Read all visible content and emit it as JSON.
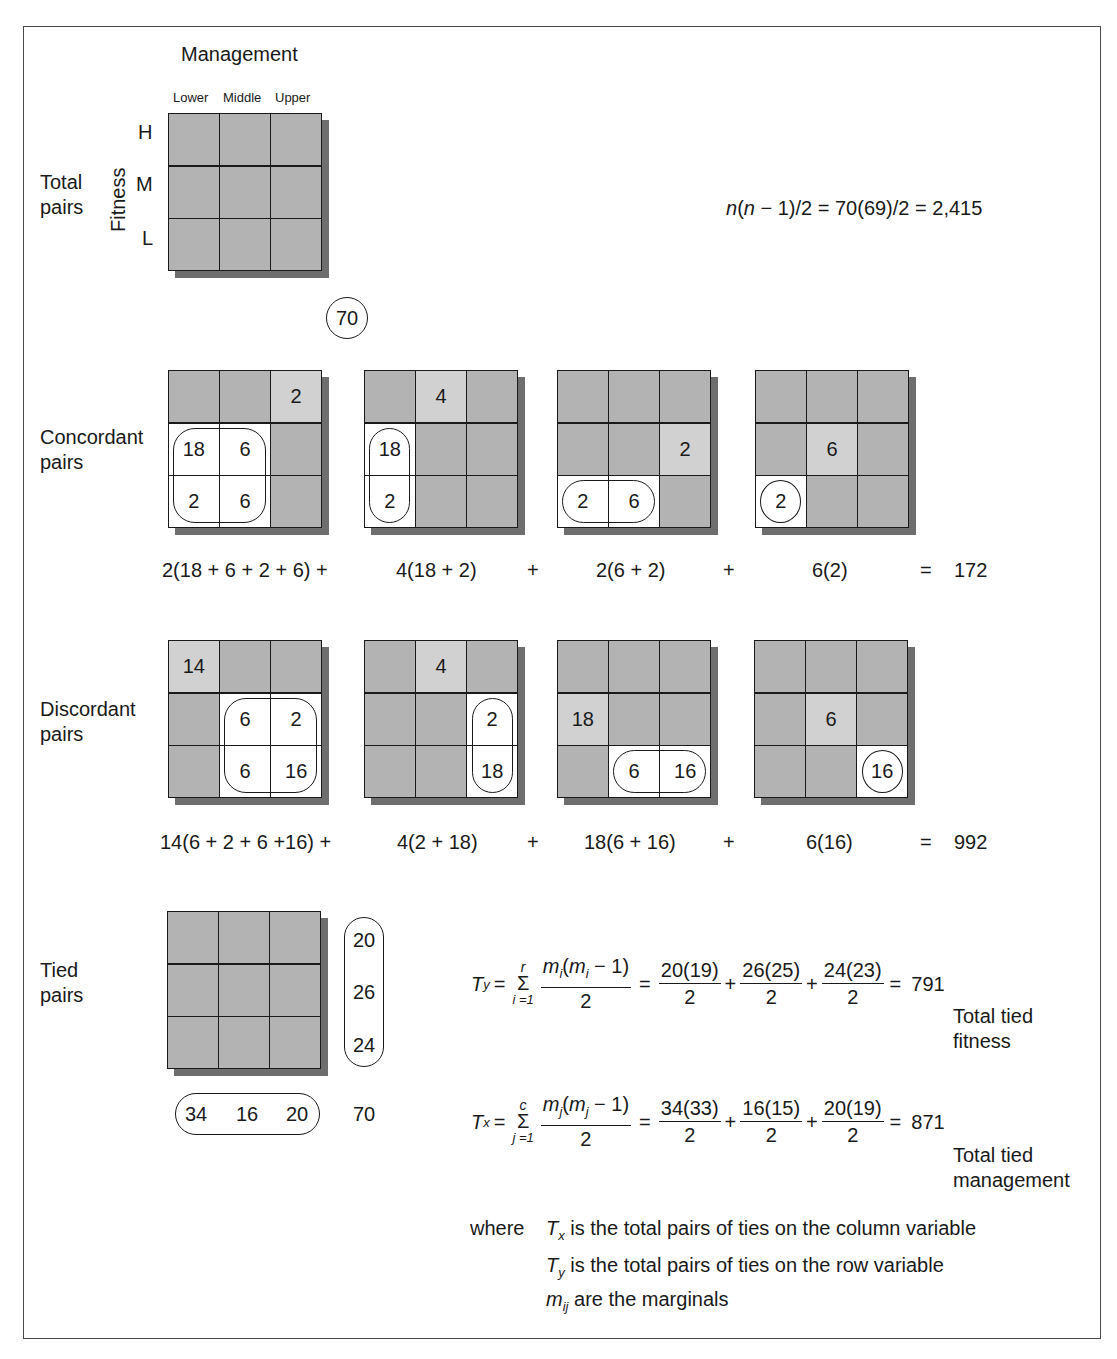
{
  "header": {
    "column_variable": "Management",
    "row_variable": "Fitness",
    "column_levels": [
      "Lower",
      "Middle",
      "Upper"
    ],
    "row_levels": [
      "H",
      "M",
      "L"
    ]
  },
  "total_pairs": {
    "label_line1": "Total",
    "label_line2": "pairs",
    "n_circle": "70",
    "formula": "n(n − 1)/2 = 70(69)/2 = 2,415"
  },
  "concordant": {
    "label_line1": "Concordant",
    "label_line2": "pairs",
    "grids": [
      {
        "cells": [
          "",
          "",
          "2",
          "18",
          "6",
          "",
          "2",
          "6",
          ""
        ],
        "highlight": [
          2,
          3,
          4,
          6,
          7
        ],
        "white": [
          3,
          4,
          6,
          7
        ]
      },
      {
        "cells": [
          "",
          "4",
          "",
          "18",
          "",
          "",
          "2",
          "",
          ""
        ],
        "highlight": [
          1,
          3,
          6
        ],
        "white": [
          3,
          6
        ]
      },
      {
        "cells": [
          "",
          "",
          "",
          "",
          "",
          "2",
          "2",
          "6",
          ""
        ],
        "highlight": [
          5,
          6,
          7
        ],
        "white": [
          6,
          7
        ]
      },
      {
        "cells": [
          "",
          "",
          "",
          "",
          "6",
          "",
          "2",
          "",
          ""
        ],
        "highlight": [
          4,
          6
        ],
        "white": [
          6
        ]
      }
    ],
    "terms": [
      "2(18 + 6 + 2 + 6)  +",
      "4(18 + 2)",
      "+",
      "2(6 + 2)",
      "+",
      "6(2)",
      "=",
      "172"
    ]
  },
  "discordant": {
    "label_line1": "Discordant",
    "label_line2": "pairs",
    "grids": [
      {
        "cells": [
          "14",
          "",
          "",
          "",
          "6",
          "2",
          "",
          "6",
          "16"
        ],
        "highlight": [
          0,
          4,
          5,
          7,
          8
        ],
        "white": [
          4,
          5,
          7,
          8
        ]
      },
      {
        "cells": [
          "",
          "4",
          "",
          "",
          "",
          "2",
          "",
          "",
          "18"
        ],
        "highlight": [
          1,
          5,
          8
        ],
        "white": [
          5,
          8
        ]
      },
      {
        "cells": [
          "",
          "",
          "",
          "18",
          "",
          "",
          "",
          "6",
          "16"
        ],
        "highlight": [
          3,
          7,
          8
        ],
        "white": [
          7,
          8
        ]
      },
      {
        "cells": [
          "",
          "",
          "",
          "",
          "6",
          "",
          "",
          "",
          "16"
        ],
        "highlight": [
          4,
          8
        ],
        "white": [
          8
        ]
      }
    ],
    "terms": [
      "14(6 + 2 + 6 +16) +",
      "4(2 + 18)",
      "+",
      "18(6 + 16)",
      "+",
      "6(16)",
      "=",
      "992"
    ]
  },
  "tied": {
    "label_line1": "Tied",
    "label_line2": "pairs",
    "row_marginals": [
      "20",
      "26",
      "24"
    ],
    "col_marginals": [
      "34",
      "16",
      "20"
    ],
    "total": "70",
    "ty": {
      "lhs": "T",
      "lhs_sub": "y",
      "sigma_upper": "r",
      "sigma_lower": "i =1",
      "general_num": "m(m − 1)",
      "general_den": "2",
      "fracs": [
        {
          "num": "20(19)",
          "den": "2"
        },
        {
          "num": "26(25)",
          "den": "2"
        },
        {
          "num": "24(23)",
          "den": "2"
        }
      ],
      "result": "791",
      "caption_line1": "Total tied",
      "caption_line2": "fitness"
    },
    "tx": {
      "lhs": "T",
      "lhs_sub": "x",
      "sigma_upper": "c",
      "sigma_lower": "j =1",
      "general_num": "m(m − 1)",
      "general_den": "2",
      "fracs": [
        {
          "num": "34(33)",
          "den": "2"
        },
        {
          "num": "16(15)",
          "den": "2"
        },
        {
          "num": "20(19)",
          "den": "2"
        }
      ],
      "result": "871",
      "caption_line1": "Total tied",
      "caption_line2": "management"
    }
  },
  "legend": {
    "where": "where",
    "lines": [
      {
        "sym": "T",
        "sub": "x",
        "text": " is the total pairs of ties on the column variable"
      },
      {
        "sym": "T",
        "sub": "y",
        "text": " is the total pairs of ties on the row variable"
      },
      {
        "sym": "m",
        "sub": "ij",
        "text": " are the marginals"
      }
    ]
  },
  "colors": {
    "cell": "#b3b3b3",
    "highlight_cell": "#d1d1d1",
    "shadow": "#6e6e6e",
    "line": "#1a1a1a"
  }
}
